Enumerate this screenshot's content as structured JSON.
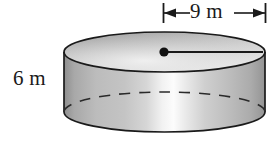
{
  "figure": {
    "shape": "cylinder",
    "labels": {
      "diameter": "9 m",
      "height": "6 m"
    },
    "measurements": {
      "diameter_value": 9,
      "diameter_unit": "m",
      "height_value": 6,
      "height_unit": "m"
    },
    "annotations": {
      "center_point": "center-dot",
      "radius_line": "radius-segment",
      "dimension_arrow": "double-headed-arrow",
      "hidden_edge": "dashed-back-arc"
    },
    "colors": {
      "outline": "#1a1a1a",
      "body_light": "#fbfbfb",
      "body_mid": "#b9b9b9",
      "body_dark": "#8d8d8d",
      "top_light": "#e6e6e6",
      "top_mid": "#c2c2c2",
      "top_dark": "#9a9a9a",
      "background": "#ffffff"
    },
    "geometry": {
      "center_x": 164.5,
      "radius_x": 100.5,
      "radius_y": 20,
      "top_center_y": 52,
      "bottom_center_y": 112,
      "dot_x": 164,
      "dot_y": 52,
      "radius_line_end_x": 263,
      "dim_line_y": 13,
      "dim_tick_left_x": 163.5,
      "dim_tick_right_x": 265.5
    }
  }
}
